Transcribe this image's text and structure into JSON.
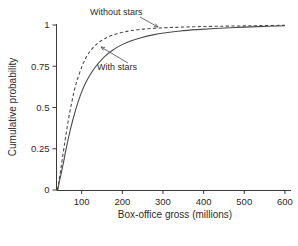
{
  "chart_data": {
    "type": "line",
    "title": "",
    "xlabel": "Box-office gross (millions)",
    "ylabel": "Cumulative probability",
    "xlim": [
      38,
      615
    ],
    "ylim": [
      0,
      1
    ],
    "xticks": [
      100,
      200,
      300,
      400,
      500,
      600
    ],
    "xtick_labels": [
      "100",
      "200",
      "300",
      "400",
      "500",
      "600"
    ],
    "yticks": [
      0,
      0.25,
      0.5,
      0.75,
      1
    ],
    "ytick_labels": [
      "0",
      "0.25",
      "0.5",
      "0.75",
      "1"
    ],
    "grid": false,
    "legend_position": "inline-annotations",
    "series": [
      {
        "name": "Without stars",
        "style": "dashed",
        "color": "#4a4a4a",
        "x": [
          40,
          44,
          48,
          52,
          57,
          62,
          68,
          75,
          82,
          90,
          100,
          110,
          122,
          135,
          150,
          167,
          185,
          205,
          228,
          252,
          280,
          310,
          345,
          385,
          430,
          480,
          535,
          600
        ],
        "y": [
          0.0,
          0.055,
          0.115,
          0.185,
          0.265,
          0.345,
          0.435,
          0.525,
          0.605,
          0.675,
          0.745,
          0.8,
          0.845,
          0.88,
          0.908,
          0.93,
          0.946,
          0.958,
          0.968,
          0.975,
          0.98,
          0.984,
          0.987,
          0.99,
          0.992,
          0.994,
          0.996,
          0.998
        ]
      },
      {
        "name": "With stars",
        "style": "solid",
        "color": "#4a4a4a",
        "x": [
          41,
          45,
          50,
          55,
          60,
          66,
          73,
          81,
          90,
          100,
          112,
          125,
          140,
          157,
          176,
          197,
          220,
          246,
          275,
          307,
          343,
          383,
          428,
          478,
          533,
          600
        ],
        "y": [
          0.0,
          0.05,
          0.105,
          0.165,
          0.23,
          0.3,
          0.375,
          0.45,
          0.525,
          0.595,
          0.66,
          0.715,
          0.765,
          0.81,
          0.847,
          0.878,
          0.903,
          0.923,
          0.94,
          0.953,
          0.964,
          0.972,
          0.979,
          0.985,
          0.99,
          0.995
        ]
      }
    ],
    "annotations": [
      {
        "text": "Without stars",
        "text_x": 90,
        "text_y": 15,
        "arrow_from_x": 140,
        "arrow_from_y": 17,
        "arrow_to_x": 158,
        "arrow_to_y": 27
      },
      {
        "text": "With stars",
        "text_x": 97,
        "text_y": 70,
        "arrow_from_x": 128,
        "arrow_from_y": 63,
        "arrow_to_x": 101,
        "arrow_to_y": 47
      }
    ]
  }
}
